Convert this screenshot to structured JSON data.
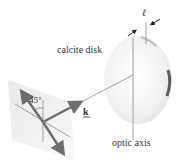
{
  "labels": {
    "calcite_disk": "calcite disk",
    "optic_axis": "optic axis",
    "angle": "45°",
    "wave_vector": "k",
    "thickness": "ℓ"
  },
  "colors": {
    "arrow": "#6e6e6e",
    "line": "#8a8a8a",
    "plate": "#ececec",
    "disk": "#f3f3f3",
    "text": "#333333"
  }
}
